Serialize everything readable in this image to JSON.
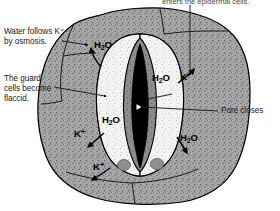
{
  "figure": {
    "width": 280,
    "height": 211,
    "background_color": "#ffffff"
  },
  "colors": {
    "epidermal_fill": "#a8a8a8",
    "guard_cell_fill": "#f2f2f0",
    "inner_wall_fill": "#8a8a8a",
    "pore_fill": "#000000",
    "nucleus_fill": "#8f8f8f",
    "outline": "#000000",
    "text": "#1a1a1a"
  },
  "callouts": [
    {
      "id": "k-enters-epidermal",
      "text": "enters the epidermal cells.",
      "position": "top",
      "clipped": true
    },
    {
      "id": "water-follows",
      "text": "Water follows K⁺\nby osmosis.",
      "position": "upper-left"
    },
    {
      "id": "guard-cells-flaccid",
      "text": "The guard\ncells become\nflaccid.",
      "position": "middle-left"
    },
    {
      "id": "pore-closes",
      "text": "Pore closes",
      "position": "middle-right"
    }
  ],
  "molecule_labels": [
    {
      "id": "h2o-upper-left",
      "formula": "H2O",
      "arrow": "up-left"
    },
    {
      "id": "h2o-upper-right",
      "formula": "H2O",
      "arrow": "none"
    },
    {
      "id": "k-upper-right",
      "formula": "K+",
      "arrow": "up-right"
    },
    {
      "id": "h2o-lower-left",
      "formula": "H2O",
      "arrow": "none"
    },
    {
      "id": "k-mid-left",
      "formula": "K+",
      "arrow": "down-left"
    },
    {
      "id": "k-bottom-left",
      "formula": "K+",
      "arrow": "down-left"
    },
    {
      "id": "h2o-lower-right",
      "formula": "H2O",
      "arrow": "down-right"
    }
  ],
  "text": {
    "h2o_main": "H",
    "h2o_sub": "2",
    "h2o_tail": "O",
    "k_main": "K",
    "k_sup": "+"
  },
  "structures": [
    {
      "id": "epidermal-cells",
      "label": "Epidermal cells"
    },
    {
      "id": "guard-cell-left",
      "label": "Left guard cell"
    },
    {
      "id": "guard-cell-right",
      "label": "Right guard cell"
    },
    {
      "id": "stomatal-pore",
      "label": "Stomatal pore (closed)"
    },
    {
      "id": "nucleus-left",
      "label": "Left guard cell nucleus"
    },
    {
      "id": "nucleus-right",
      "label": "Right guard cell nucleus"
    }
  ]
}
